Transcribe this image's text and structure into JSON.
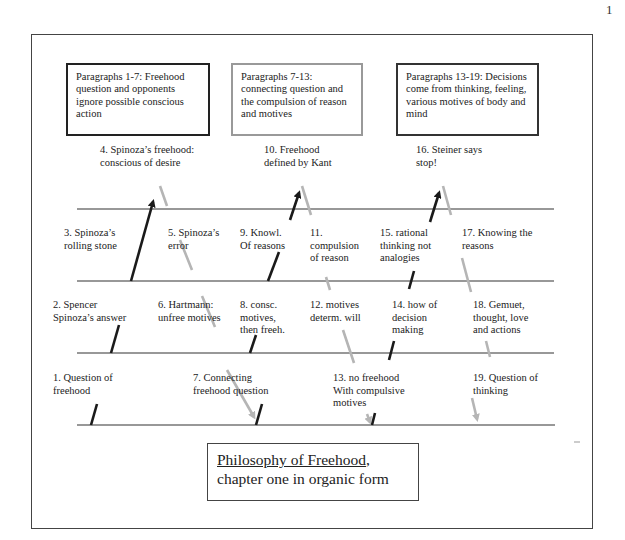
{
  "page_number": "1",
  "header_boxes": [
    {
      "text": "Paragraphs 1-7: Freehood question and opponents ignore possible conscious action",
      "lines": [
        "Paragraphs 1-7: Freehood",
        "question and opponents",
        "ignore possible conscious",
        "action"
      ],
      "border_color": "#222222"
    },
    {
      "text": "Paragraphs 7-13: connecting question and the compulsion of reason and motives",
      "lines": [
        "Paragraphs 7-13:",
        "connecting question and",
        "the compulsion of reason",
        "and motives"
      ],
      "border_color": "#999999"
    },
    {
      "text": "Paragraphs 13-19: Decisions come from thinking, feeling, various motives of body and mind",
      "lines": [
        "Paragraphs 13-19: Decisions",
        "come from thinking, feeling,",
        "various motives of body and",
        "mind"
      ],
      "border_color": "#333333"
    }
  ],
  "steps": [
    {
      "num": 1,
      "lines": [
        "1. Question of",
        "freehood"
      ]
    },
    {
      "num": 2,
      "lines": [
        "2. Spencer",
        "Spinoza’s answer"
      ]
    },
    {
      "num": 3,
      "lines": [
        "3. Spinoza’s",
        "rolling stone"
      ]
    },
    {
      "num": 4,
      "lines": [
        "4. Spinoza’s freehood:",
        "conscious of desire"
      ]
    },
    {
      "num": 5,
      "lines": [
        "5. Spinoza’s",
        "error"
      ]
    },
    {
      "num": 6,
      "lines": [
        "6. Hartmann:",
        "unfree motives"
      ]
    },
    {
      "num": 7,
      "lines": [
        "7. Connecting",
        "freehood question"
      ]
    },
    {
      "num": 8,
      "lines": [
        "8. consc.",
        "motives,",
        "then freeh."
      ]
    },
    {
      "num": 9,
      "lines": [
        "9. Knowl.",
        "Of reasons"
      ]
    },
    {
      "num": 10,
      "lines": [
        "10. Freehood",
        "defined by Kant"
      ]
    },
    {
      "num": 11,
      "lines": [
        "11.",
        "compulsion",
        "of reason"
      ]
    },
    {
      "num": 12,
      "lines": [
        "12. motives",
        "determ. will"
      ]
    },
    {
      "num": 13,
      "lines": [
        "13. no freehood",
        "With compulsive",
        "motives"
      ]
    },
    {
      "num": 14,
      "lines": [
        "14. how of",
        "decision",
        "making"
      ]
    },
    {
      "num": 15,
      "lines": [
        "15. rational",
        "thinking not",
        "analogies"
      ]
    },
    {
      "num": 16,
      "lines": [
        "16. Steiner says",
        "stop!"
      ]
    },
    {
      "num": 17,
      "lines": [
        "17. Knowing the",
        "reasons"
      ]
    },
    {
      "num": 18,
      "lines": [
        "18. Gemuet,",
        "thought, love",
        "and actions"
      ]
    },
    {
      "num": 19,
      "lines": [
        "19. Question of",
        "thinking"
      ]
    }
  ],
  "title": {
    "line1": "Philosophy of Freehood",
    "line1_suffix": ",",
    "line2": "chapter one in organic form"
  },
  "colors": {
    "ascending_arrow": "#1a1a1a",
    "descending_arrow": "#b5b5b5",
    "horizontal_line": "#333333"
  }
}
